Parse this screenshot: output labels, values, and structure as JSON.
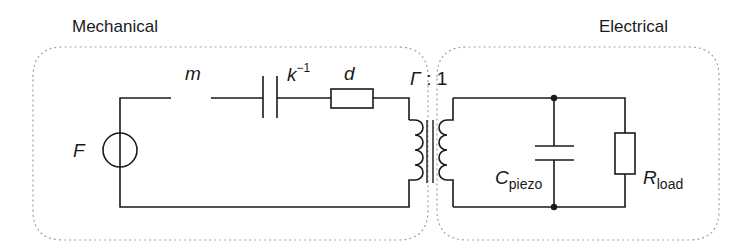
{
  "sections": {
    "mechanical": {
      "title": "Mechanical"
    },
    "electrical": {
      "title": "Electrical"
    }
  },
  "components": {
    "force_source": {
      "label": "F"
    },
    "mass": {
      "label": "m"
    },
    "compliance": {
      "label": "k",
      "superscript": "−1"
    },
    "damper": {
      "label": "d"
    },
    "transformer": {
      "ratio_symbol": "Γ",
      "ratio_sep": ":",
      "ratio_value": "1"
    },
    "piezo_capacitor": {
      "label": "C",
      "subscript": "piezo"
    },
    "load_resistor": {
      "label": "R",
      "subscript": "load"
    }
  },
  "colors": {
    "wire": "#1a1a1a",
    "boundary": "#9a9a9a"
  }
}
